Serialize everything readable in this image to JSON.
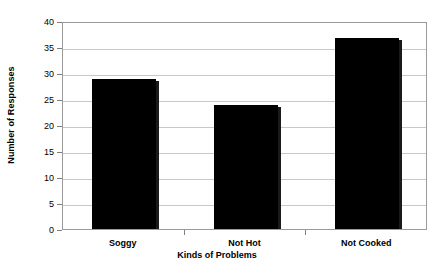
{
  "chart_data": {
    "type": "bar",
    "title": "",
    "subtitle": "",
    "xlabel": "Kinds of Problems",
    "ylabel": "Number of Responses",
    "categories": [
      "Soggy",
      "Not Hot",
      "Not Cooked"
    ],
    "values": [
      29,
      24,
      37
    ],
    "series": [
      {
        "name": "Number of Responses",
        "values": [
          29,
          24,
          37
        ]
      }
    ],
    "ylim": [
      0,
      40
    ],
    "yticks": [
      0,
      5,
      10,
      15,
      20,
      25,
      30,
      35,
      40
    ],
    "ytick_labels": [
      "0",
      "5",
      "10",
      "15",
      "20",
      "25",
      "30",
      "35",
      "40"
    ],
    "grid": true,
    "grid_axis": "y",
    "legend": false,
    "legend_position": "none",
    "bar_color": "#000000",
    "grid_color": "#c8c8c8",
    "frame_color": "#9a9a9a",
    "background_color": "#ffffff",
    "text_color": "#000000",
    "annotations": []
  }
}
